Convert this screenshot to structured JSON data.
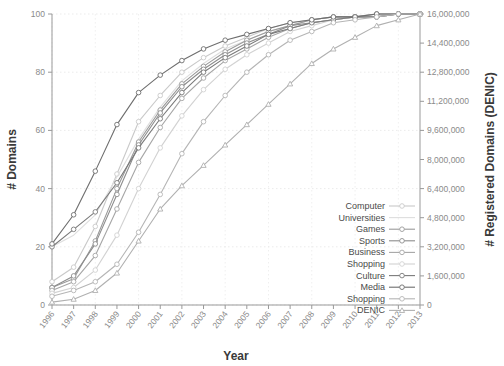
{
  "chart_data": {
    "type": "line",
    "title": "",
    "xlabel": "Year",
    "ylabel": "# Domains",
    "y2label": "# Registered Domains (DENIC)",
    "grid": true,
    "legend_position": "inside-right",
    "x": [
      1996,
      1997,
      1998,
      1999,
      2000,
      2001,
      2002,
      2003,
      2004,
      2005,
      2006,
      2007,
      2008,
      2009,
      2010,
      2011,
      2012,
      2013
    ],
    "xtick_labels": [
      "1996",
      "1997",
      "1998",
      "1999",
      "2000",
      "2001",
      "2002",
      "2003",
      "2004",
      "2005",
      "2006",
      "2007",
      "2008",
      "2009",
      "2010",
      "2011",
      "2012",
      "2013"
    ],
    "ylim": [
      0,
      100
    ],
    "ytick_labels": [
      "0",
      "20",
      "40",
      "60",
      "80",
      "100"
    ],
    "ytick_values": [
      0,
      20,
      40,
      60,
      80,
      100
    ],
    "y2lim": [
      0,
      16000000
    ],
    "y2tick_labels": [
      "0",
      "1,600,000",
      "3,200,000",
      "4,800,000",
      "6,400,000",
      "8,000,000",
      "9,600,000",
      "11,200,000",
      "12,800,000",
      "14,400,000",
      "16,000,000"
    ],
    "y2tick_values": [
      0,
      1600000,
      3200000,
      4800000,
      6400000,
      8000000,
      9600000,
      11200000,
      12800000,
      14400000,
      16000000
    ],
    "series": [
      {
        "name": "Computer",
        "color": "#c9c9c9",
        "marker": "circle",
        "axis": "left",
        "values": [
          8,
          13,
          27,
          45,
          63,
          72,
          80,
          85,
          89,
          92,
          95,
          97,
          98,
          99,
          99,
          100,
          100,
          100
        ]
      },
      {
        "name": "Universities",
        "color": "#dedede",
        "marker": "none",
        "axis": "left",
        "values": [
          20,
          24,
          31,
          44,
          57,
          68,
          77,
          83,
          88,
          91,
          94,
          96,
          98,
          99,
          99,
          100,
          100,
          100
        ]
      },
      {
        "name": "Games",
        "color": "#9a9a9a",
        "marker": "circle",
        "axis": "left",
        "values": [
          6,
          9,
          22,
          40,
          56,
          67,
          76,
          82,
          87,
          91,
          94,
          96,
          98,
          99,
          99,
          100,
          100,
          100
        ]
      },
      {
        "name": "Sports",
        "color": "#8d8d8d",
        "marker": "circle",
        "axis": "left",
        "values": [
          6,
          10,
          21,
          38,
          55,
          66,
          75,
          81,
          86,
          90,
          93,
          96,
          97,
          98,
          99,
          99,
          100,
          100
        ]
      },
      {
        "name": "Business",
        "color": "#a6a6a6",
        "marker": "circle",
        "axis": "left",
        "values": [
          5,
          8,
          17,
          33,
          49,
          61,
          71,
          78,
          84,
          88,
          92,
          95,
          97,
          98,
          99,
          99,
          100,
          100
        ]
      },
      {
        "name": "Shopping",
        "color": "#d2d2d2",
        "marker": "circle",
        "axis": "left",
        "values": [
          4,
          6,
          12,
          24,
          40,
          54,
          65,
          74,
          81,
          86,
          90,
          94,
          96,
          98,
          99,
          99,
          100,
          100
        ]
      },
      {
        "name": "Culture",
        "color": "#7a7a7a",
        "marker": "circle",
        "axis": "left",
        "values": [
          20,
          26,
          32,
          42,
          54,
          64,
          73,
          80,
          85,
          89,
          93,
          95,
          97,
          98,
          99,
          99,
          100,
          100
        ]
      },
      {
        "name": "Media",
        "color": "#6e6e6e",
        "marker": "circle",
        "axis": "left",
        "values": [
          21,
          31,
          46,
          62,
          73,
          79,
          84,
          88,
          91,
          93,
          95,
          97,
          98,
          99,
          99,
          100,
          100,
          100
        ]
      },
      {
        "name": "Shopping",
        "color": "#b5b5b5",
        "marker": "circle",
        "axis": "left",
        "values": [
          3,
          5,
          8,
          14,
          25,
          38,
          52,
          63,
          72,
          80,
          86,
          91,
          94,
          97,
          98,
          99,
          100,
          100
        ]
      },
      {
        "name": "DENIC",
        "color": "#b0b0b0",
        "marker": "triangle",
        "axis": "right",
        "values": [
          1,
          2,
          5,
          11,
          22,
          33,
          41,
          48,
          55,
          62,
          69,
          76,
          83,
          88,
          92,
          96,
          98,
          100
        ]
      }
    ]
  },
  "legend": {
    "items": [
      {
        "label": "Computer"
      },
      {
        "label": "Universities"
      },
      {
        "label": "Games"
      },
      {
        "label": "Sports"
      },
      {
        "label": "Business"
      },
      {
        "label": "Shopping"
      },
      {
        "label": "Culture"
      },
      {
        "label": "Media"
      },
      {
        "label": "Shopping"
      },
      {
        "label": "DENIC"
      }
    ]
  }
}
